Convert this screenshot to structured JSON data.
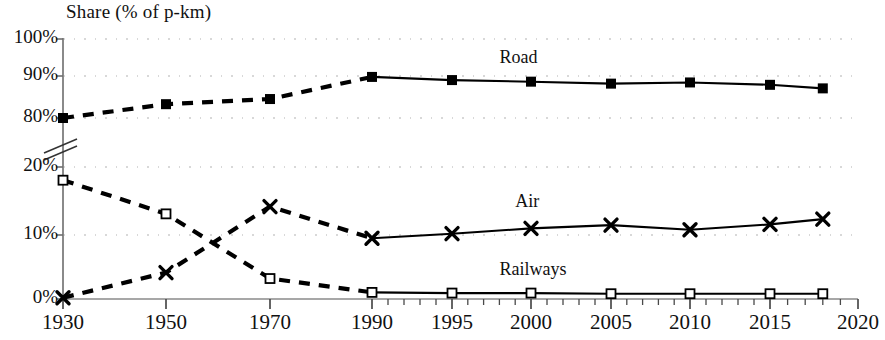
{
  "chart_data": {
    "type": "line",
    "title": "Share (% of p-km)",
    "xlabel": "",
    "ylabel": "Share (% of p-km)",
    "axis_break": true,
    "ylim_lower": [
      0,
      20
    ],
    "ylim_upper": [
      80,
      100
    ],
    "ytick_labels": [
      "100%",
      "90%",
      "80%",
      "20%",
      "10%",
      "0%"
    ],
    "ytick_values": [
      100,
      90,
      80,
      20,
      10,
      0
    ],
    "xtick_labels": [
      "1930",
      "1950",
      "1970",
      "1990",
      "1995",
      "2000",
      "2005",
      "2010",
      "2015",
      "2020"
    ],
    "xtick_values": [
      1930,
      1950,
      1970,
      1990,
      1995,
      2000,
      2005,
      2010,
      2015,
      2020
    ],
    "grid": true,
    "legend": "inline-labels",
    "x": [
      1930,
      1950,
      1970,
      1990,
      1995,
      2000,
      2005,
      2010,
      2015,
      2018
    ],
    "series": [
      {
        "name": "Road",
        "marker": "filled-square",
        "label_x": 1998,
        "label_y": 95,
        "values": [
          80.0,
          83.5,
          84.8,
          90.4,
          89.6,
          89.2,
          88.7,
          89.0,
          88.4,
          87.5
        ]
      },
      {
        "name": "Air",
        "marker": "cross",
        "label_x": 1999,
        "label_y": 14.5,
        "values": [
          0.2,
          4.0,
          14.0,
          9.2,
          9.9,
          10.7,
          11.2,
          10.5,
          11.3,
          12.1
        ]
      },
      {
        "name": "Railways",
        "marker": "hollow-square",
        "label_x": 1998,
        "label_y": 4.2,
        "values": [
          18.0,
          12.9,
          3.1,
          1.0,
          0.9,
          0.9,
          0.8,
          0.8,
          0.8,
          0.8
        ]
      }
    ],
    "line_style_note": "dashed before 1990, solid from 1990 onward"
  }
}
